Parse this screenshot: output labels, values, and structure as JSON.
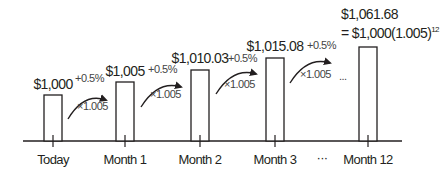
{
  "diagram": {
    "title": "",
    "categories": [
      "Today",
      "Month 1",
      "Month 2",
      "Month 3",
      "...",
      "Month 12"
    ],
    "bars": [
      {
        "category": "Today",
        "label": "$1,000",
        "value": 1000.0
      },
      {
        "category": "Month 1",
        "label": "$1,005",
        "value": 1005.0
      },
      {
        "category": "Month 2",
        "label": "$1,010.03",
        "value": 1010.03
      },
      {
        "category": "Month 3",
        "label": "$1,015.08",
        "value": 1015.08
      },
      {
        "category": "Month 12",
        "label": "$1,061.68",
        "value": 1061.68,
        "formula": "= $1,000(1.005)",
        "formula_exponent": "12"
      }
    ],
    "arrows": [
      {
        "rate": "+0.5%",
        "multiplier": "×1.005"
      },
      {
        "rate": "+0.5%",
        "multiplier": "×1.005"
      },
      {
        "rate": "+0.5%",
        "multiplier": "×1.005"
      },
      {
        "rate": "+0.5%",
        "multiplier": "×1.005"
      }
    ],
    "ellipsis": "...",
    "axis_ellipsis": "···"
  }
}
